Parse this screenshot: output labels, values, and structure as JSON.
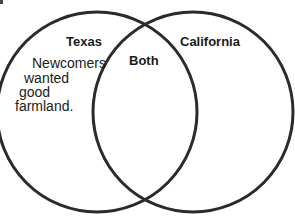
{
  "diagram": {
    "type": "venn",
    "circles": [
      {
        "id": "left",
        "label": "Texas",
        "cx": 97,
        "cy": 112,
        "r": 100
      },
      {
        "id": "right",
        "label": "California",
        "cx": 193,
        "cy": 112,
        "r": 100
      }
    ],
    "stroke_color": "#2b2b2b",
    "labels": {
      "left_title": "Texas",
      "right_title": "California",
      "overlap_title": "Both"
    },
    "left_body": [
      "Newcomers",
      "wanted",
      "good",
      "farmland."
    ],
    "right_body": [],
    "overlap_body": []
  }
}
